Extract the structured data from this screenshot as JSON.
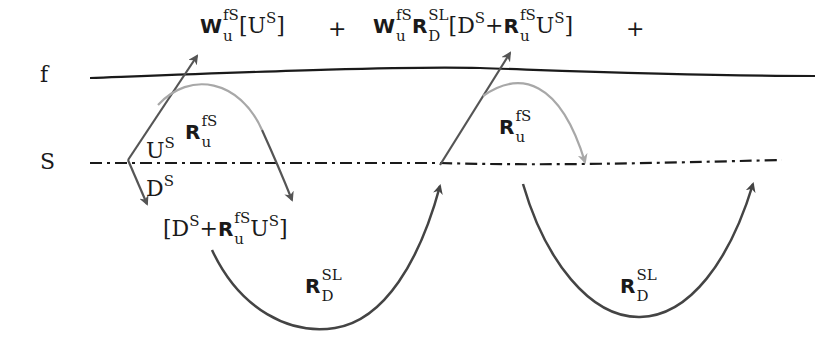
{
  "level_labels": {
    "f": "f",
    "S": "S"
  },
  "equation": {
    "term1": {
      "W": "W",
      "W_sub": "u",
      "W_sup": "fS",
      "open": "[",
      "U": "U",
      "U_sup": "S",
      "close": "]"
    },
    "plus1": "+",
    "term2": {
      "W": "W",
      "W_sub": "u",
      "W_sup": "fS",
      "R": "R",
      "R_sub": "D",
      "R_sup": "SL",
      "open": "[",
      "D": "D",
      "D_sup": "S",
      "plus": "+",
      "R2": "R",
      "R2_sub": "u",
      "R2_sup": "fS",
      "U": "U",
      "U_sup": "S",
      "close": "]"
    },
    "plus2": "+"
  },
  "labels": {
    "U_S": {
      "base": "U",
      "sup": "S"
    },
    "D_S": {
      "base": "D",
      "sup": "S"
    },
    "R_fS_left": {
      "base": "R",
      "sub": "u",
      "sup": "fS"
    },
    "R_fS_right": {
      "base": "R",
      "sub": "u",
      "sup": "fS"
    },
    "bracket": {
      "open": "[",
      "D": "D",
      "D_sup": "S",
      "plus": "+",
      "R": "R",
      "R_sub": "u",
      "R_sup": "fS",
      "U": "U",
      "U_sup": "S",
      "close": "]"
    },
    "R_SL_left": {
      "base": "R",
      "sub": "D",
      "sup": "SL"
    },
    "R_SL_right": {
      "base": "R",
      "sub": "D",
      "sup": "SL"
    }
  },
  "colors": {
    "line_f": "#1a1a1a",
    "line_S": "#1a1a1a",
    "arrow_dark": "#555555",
    "arrow_light": "#a8a8a8",
    "curve_dark": "#444444"
  }
}
